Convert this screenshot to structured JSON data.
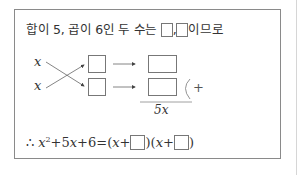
{
  "statement": {
    "prefix": "합이 5, 곱이 6인 두 수는 ",
    "separator": ",",
    "suffix": "이므로"
  },
  "diagram": {
    "left_terms": [
      "x",
      "x"
    ],
    "sum_label": "5x",
    "bracket_label": "+"
  },
  "conclusion": {
    "therefore": "∴",
    "lhs_x": "x",
    "lhs_exp": "2",
    "lhs_rest": "+5",
    "lhs_x2": "x",
    "lhs_const": "+6=(",
    "f1_x": "x",
    "f1_plus": "+",
    "f1_close": ")(",
    "f2_x": "x",
    "f2_plus": "+",
    "f2_close": ")"
  }
}
